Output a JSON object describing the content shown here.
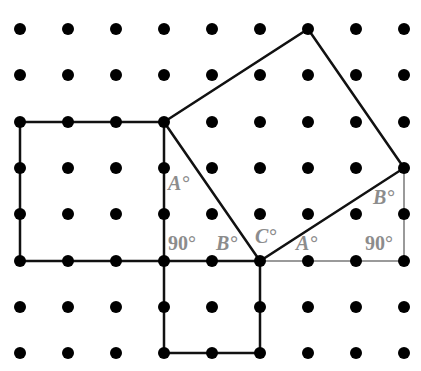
{
  "grid": {
    "columns_x": [
      20,
      68,
      116,
      164,
      212,
      260,
      308,
      356,
      404
    ],
    "rows_y": [
      29,
      75,
      122,
      168,
      214,
      261,
      307,
      353
    ],
    "dot_radius": 6,
    "dot_color": "#000000"
  },
  "colors": {
    "shape_stroke": "#111111",
    "helper_stroke": "#9a9a9a",
    "label": "#8c8c8c",
    "background": "#ffffff"
  },
  "shapes": {
    "left_square": {
      "points": [
        [
          20,
          122
        ],
        [
          164,
          122
        ],
        [
          164,
          261
        ],
        [
          20,
          261
        ]
      ],
      "side_units": 3
    },
    "bottom_square": {
      "points": [
        [
          164,
          261
        ],
        [
          260,
          261
        ],
        [
          260,
          353
        ],
        [
          164,
          353
        ]
      ],
      "side_units": 2
    },
    "tilted_square": {
      "points": [
        [
          164,
          122
        ],
        [
          308,
          29
        ],
        [
          404,
          168
        ],
        [
          260,
          261
        ]
      ]
    }
  },
  "helper_lines": [
    {
      "from": [
        260,
        261
      ],
      "to": [
        404,
        261
      ]
    },
    {
      "from": [
        404,
        168
      ],
      "to": [
        404,
        261
      ]
    }
  ],
  "labels": {
    "left_triangle_A": "A°",
    "left_triangle_right": "90°",
    "left_triangle_B": "B°",
    "center_C": "C°",
    "right_triangle_A": "A°",
    "right_triangle_B": "B°",
    "right_triangle_right": "90°"
  }
}
